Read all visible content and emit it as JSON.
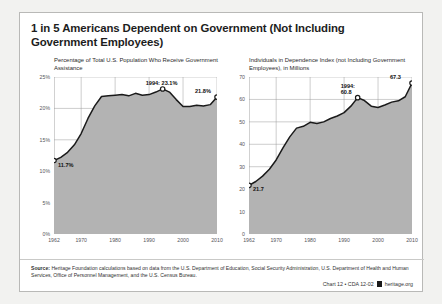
{
  "title": "1 in 5 Americans Dependent on Government (Not Including Government Employees)",
  "footer": {
    "source_label": "Source:",
    "source_text": " Heritage Foundation calculations based on data from the U.S. Department of Education, Social Security Administration, U.S. Department of Health and Human Services, Office of Personnel Management, and the U.S. Census Bureau.",
    "credit": "Chart 12 • CDA 12-02",
    "site": "heritage.org",
    "logo_icon": "heritage-mark-icon"
  },
  "colors": {
    "area_fill": "#b3b3b3",
    "line": "#1a1a1a",
    "grid": "#9a9a9a",
    "axis_text": "#55555a",
    "card_border": "#b9b9b7",
    "page_background": "#f2f2f0"
  },
  "chart_data": [
    {
      "type": "area",
      "id": "percentage-chart",
      "title": "Percentage of Total U.S. Population Who Receive Government Assistance",
      "xlabel": "",
      "ylabel": "",
      "xlim": [
        1962,
        2010
      ],
      "ylim": [
        0,
        25
      ],
      "xticks": [
        1962,
        1970,
        1980,
        1990,
        2000,
        2010
      ],
      "yticks": [
        0,
        5,
        10,
        15,
        20,
        25
      ],
      "ytick_labels": [
        "0%",
        "5%",
        "10%",
        "15%",
        "20%",
        "25%"
      ],
      "grid": true,
      "legend": "none",
      "annotations": [
        {
          "label": "11.7%",
          "x": 1962,
          "y": 11.7,
          "marker": true
        },
        {
          "label": "1994: 23.1%",
          "x": 1994,
          "y": 23.1,
          "marker": true
        },
        {
          "label": "21.8%",
          "x": 2010,
          "y": 21.8,
          "marker": true
        }
      ],
      "x": [
        1962,
        1964,
        1966,
        1968,
        1970,
        1972,
        1974,
        1976,
        1978,
        1980,
        1982,
        1984,
        1986,
        1988,
        1990,
        1992,
        1994,
        1996,
        1998,
        2000,
        2002,
        2004,
        2006,
        2008,
        2010
      ],
      "values": [
        11.7,
        12.2,
        13.0,
        14.2,
        16.0,
        18.4,
        20.4,
        21.9,
        22.0,
        22.1,
        22.2,
        22.0,
        22.4,
        22.1,
        22.2,
        22.6,
        23.1,
        22.6,
        21.4,
        20.3,
        20.3,
        20.5,
        20.4,
        20.6,
        21.8
      ]
    },
    {
      "type": "area",
      "id": "individuals-chart",
      "title": "Individuals in Dependence Index (not Including Government Employees), in Millions",
      "xlabel": "",
      "ylabel": "",
      "xlim": [
        1962,
        2010
      ],
      "ylim": [
        0,
        70
      ],
      "xticks": [
        1962,
        1970,
        1980,
        1990,
        2000,
        2010
      ],
      "yticks": [
        0,
        10,
        20,
        30,
        40,
        50,
        60,
        70
      ],
      "ytick_labels": [
        "0",
        "10",
        "20",
        "30",
        "40",
        "50",
        "60",
        "70"
      ],
      "grid": true,
      "legend": "none",
      "annotations": [
        {
          "label": "21.7",
          "x": 1962,
          "y": 21.7,
          "marker": true
        },
        {
          "label": "1994:\n60.8",
          "x": 1994,
          "y": 60.8,
          "marker": true
        },
        {
          "label": "67.3",
          "x": 2010,
          "y": 67.3,
          "marker": true
        }
      ],
      "x": [
        1962,
        1964,
        1966,
        1968,
        1970,
        1972,
        1974,
        1976,
        1978,
        1980,
        1982,
        1984,
        1986,
        1988,
        1990,
        1992,
        1994,
        1996,
        1998,
        2000,
        2002,
        2004,
        2006,
        2008,
        2010
      ],
      "values": [
        21.7,
        23.4,
        25.8,
        28.9,
        33.0,
        38.4,
        43.3,
        47.2,
        48.0,
        49.8,
        49.3,
        50.0,
        51.5,
        52.6,
        54.1,
        57.0,
        60.8,
        59.5,
        57.0,
        56.4,
        57.5,
        58.8,
        59.4,
        61.2,
        67.3
      ]
    }
  ]
}
